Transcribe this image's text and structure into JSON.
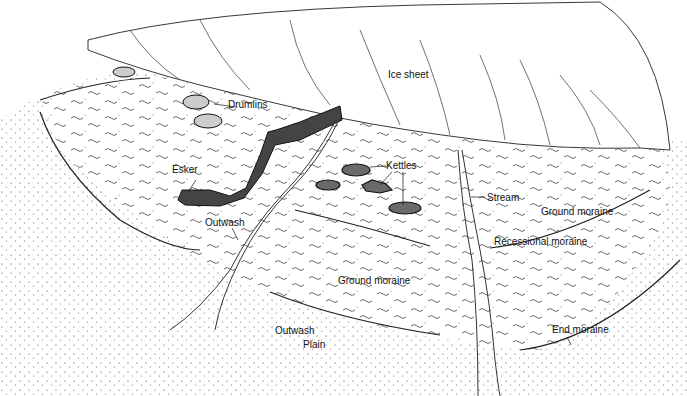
{
  "diagram": {
    "labels": {
      "ice_sheet": "Ice sheet",
      "drumlins": "Drumlins",
      "esker": "Esker",
      "outwash": "Outwash",
      "kettles": "Kettles",
      "stream": "Stream",
      "ground_moraine_right": "Ground moraine",
      "recessional_moraine": "Recessional moraine",
      "ground_moraine_center": "Ground moraine",
      "end_moraine": "End moraine",
      "outwash_plain_line1": "Outwash",
      "outwash_plain_line2": "Plain"
    },
    "colors": {
      "line": "#111111",
      "kettle_fill": "#6a6a6a",
      "background": "#ffffff"
    }
  }
}
